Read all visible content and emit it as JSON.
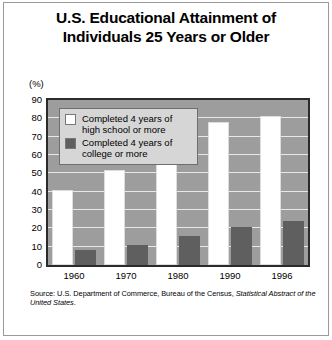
{
  "title": "U.S. Educational Attainment of Individuals 25 Years or Older",
  "title_line1": "U.S. Educational Attainment of",
  "title_line2": "Individuals 25 Years or Older",
  "axis_unit_label": "(%)",
  "source_prefix": "Source: U.S. Department of Commerce, Bureau of the Census, ",
  "source_italic": "Statistical Abstract of the United States",
  "source_suffix": ".",
  "legend": [
    {
      "label_line1": "Completed 4 years of",
      "label_line2": "high school or more",
      "color": "#ffffff"
    },
    {
      "label_line1": "Completed 4 years of",
      "label_line2": "college or more",
      "color": "#5f5f5f"
    }
  ],
  "colors": {
    "plot_background": "#9d9d9d",
    "gridline": "#e8e8e8",
    "plot_border": "#2b2b2b",
    "high_school_bar": "#ffffff",
    "college_bar": "#5f5f5f",
    "legend_background": "#d6d6d6",
    "figure_frame": "#9a9a9a",
    "text": "#000000"
  },
  "chart_data": {
    "type": "bar",
    "title": "U.S. Educational Attainment of Individuals 25 Years or Older",
    "xlabel": "",
    "ylabel": "(%)",
    "ylim": [
      0,
      90
    ],
    "yticks": [
      0,
      10,
      20,
      30,
      40,
      50,
      60,
      70,
      80,
      90
    ],
    "ytick_labels": [
      "0",
      "10",
      "20",
      "30",
      "40",
      "50",
      "60",
      "70",
      "80",
      "90"
    ],
    "grid": true,
    "legend_position": "upper-left-inside",
    "categories": [
      "1960",
      "1970",
      "1980",
      "1990",
      "1996"
    ],
    "series": [
      {
        "name": "Completed 4 years of high school or more",
        "color": "#ffffff",
        "values": [
          41,
          52,
          67,
          78,
          81.5
        ]
      },
      {
        "name": "Completed 4 years of college or more",
        "color": "#5f5f5f",
        "values": [
          8,
          11,
          16,
          21,
          24
        ]
      }
    ]
  }
}
